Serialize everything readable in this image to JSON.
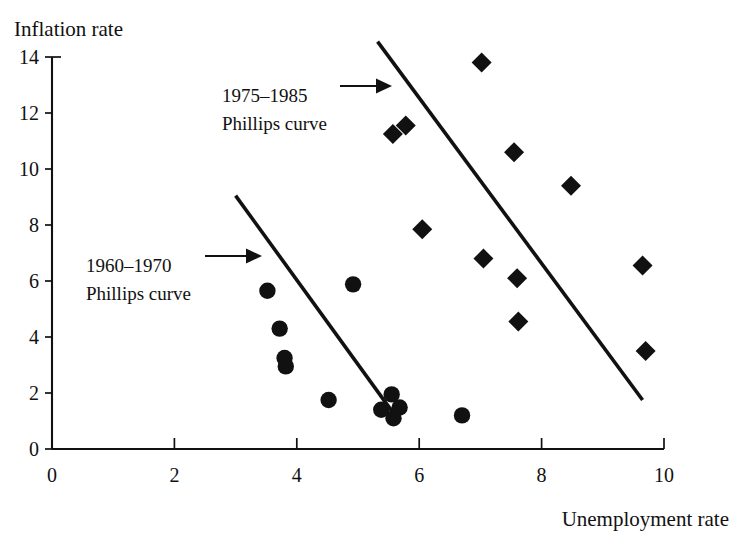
{
  "chart_data": {
    "type": "scatter",
    "title": "",
    "xlabel": "Unemployment rate",
    "ylabel": "Inflation rate",
    "xlim": [
      0,
      10
    ],
    "ylim": [
      0,
      14
    ],
    "xticks": [
      0,
      2,
      4,
      6,
      8,
      10
    ],
    "yticks": [
      0,
      2,
      4,
      6,
      8,
      10,
      12,
      14
    ],
    "xtick_labels": [
      "0",
      "2",
      "4",
      "6",
      "8",
      "10"
    ],
    "ytick_labels": [
      "0",
      "2",
      "4",
      "6",
      "8",
      "10",
      "12",
      "14"
    ],
    "grid": false,
    "legend_position": "none",
    "series": [
      {
        "name": "1960-1970",
        "marker": "circle",
        "color": "#111111",
        "points": [
          {
            "x": 3.52,
            "y": 5.65
          },
          {
            "x": 3.72,
            "y": 4.3
          },
          {
            "x": 3.8,
            "y": 3.25
          },
          {
            "x": 3.82,
            "y": 2.95
          },
          {
            "x": 4.52,
            "y": 1.75
          },
          {
            "x": 4.92,
            "y": 5.88
          },
          {
            "x": 5.38,
            "y": 1.4
          },
          {
            "x": 5.55,
            "y": 1.95
          },
          {
            "x": 5.58,
            "y": 1.1
          },
          {
            "x": 5.68,
            "y": 1.48
          },
          {
            "x": 6.7,
            "y": 1.2
          }
        ]
      },
      {
        "name": "1975-1985",
        "marker": "diamond",
        "color": "#111111",
        "points": [
          {
            "x": 5.57,
            "y": 11.25
          },
          {
            "x": 5.78,
            "y": 11.55
          },
          {
            "x": 6.05,
            "y": 7.85
          },
          {
            "x": 7.02,
            "y": 13.8
          },
          {
            "x": 7.05,
            "y": 6.8
          },
          {
            "x": 7.55,
            "y": 10.6
          },
          {
            "x": 7.6,
            "y": 6.1
          },
          {
            "x": 7.62,
            "y": 4.55
          },
          {
            "x": 8.48,
            "y": 9.4
          },
          {
            "x": 9.65,
            "y": 6.55
          },
          {
            "x": 9.7,
            "y": 3.5
          }
        ]
      }
    ],
    "trend_lines": [
      {
        "name": "1960-1970 Phillips curve",
        "x1": 3.0,
        "y1": 9.05,
        "x2": 5.63,
        "y2": 1.12
      },
      {
        "name": "1975-1985 Phillips curve",
        "x1": 5.32,
        "y1": 14.55,
        "x2": 9.65,
        "y2": 1.75
      }
    ],
    "annotations": [
      {
        "name": "annotation-1975-1985",
        "line1": "1975–1985",
        "line2": "Phillips curve",
        "text_x": 222,
        "text_y": 102,
        "arrow_x1": 340,
        "arrow_y1": 86,
        "arrow_x2": 392,
        "arrow_y2": 86
      },
      {
        "name": "annotation-1960-1970",
        "line1": "1960–1970",
        "line2": "Phillips curve",
        "text_x": 86,
        "text_y": 272,
        "arrow_x1": 205,
        "arrow_y1": 256,
        "arrow_x2": 262,
        "arrow_y2": 256
      }
    ]
  },
  "colors": {
    "foreground": "#111111",
    "background": "#ffffff"
  }
}
